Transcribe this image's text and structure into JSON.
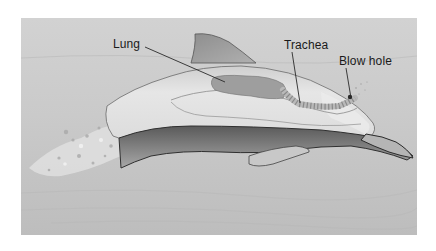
{
  "diagram": {
    "labels": [
      {
        "id": "lung",
        "text": "Lung"
      },
      {
        "id": "trachea",
        "text": "Trachea"
      },
      {
        "id": "blow_hole",
        "text": "Blow hole"
      }
    ],
    "colors": {
      "background_water": "#c9c9c9",
      "body_light": "#e3e3e3",
      "body_mid": "#bdbdbd",
      "lung_fill": "#9a9a9a",
      "outline_dark": "#3a3a3a",
      "label_text": "#1a1a1a",
      "page_bg": "#ffffff"
    }
  }
}
